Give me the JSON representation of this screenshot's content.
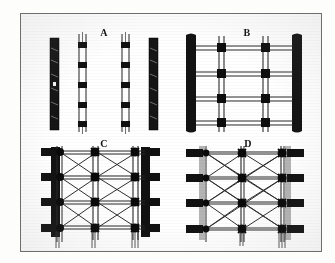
{
  "plate": {
    "background_color": "#ffffff",
    "page_color": "#fdfdfc",
    "border_color": "#6e6e6e",
    "ink_color": "#111111",
    "gray_ink_color": "#9a9a9a"
  },
  "figures": [
    {
      "id": "A",
      "label": "A",
      "caption": "A",
      "description": "Four separate vertical framing members shown in isolation: two solid dark posts and two slotted posts with spaced connector blocks",
      "members": [
        {
          "kind": "solid-post",
          "fill": "#111111"
        },
        {
          "kind": "slotted-post",
          "blocks": 5,
          "fill": "#111111"
        },
        {
          "kind": "slotted-post",
          "blocks": 5,
          "fill": "#111111"
        },
        {
          "kind": "solid-post",
          "fill": "#111111"
        }
      ]
    },
    {
      "id": "B",
      "label": "B",
      "caption": "B",
      "description": "Rectangular grid frame: two heavy outer posts, two inner vertical members and four horizontal rails with square junction blocks, no diagonal bracing",
      "posts": 2,
      "inner_verticals": 2,
      "horizontal_rails": 4,
      "junction_blocks": 8,
      "bracing": "none"
    },
    {
      "id": "C",
      "label": "C",
      "caption": "C",
      "description": "Braced grid frame with heavy black outer posts carrying four tie tabs each, star-shaped junction nodes and diagonal cross bracing in every bay",
      "posts": 2,
      "post_style": "heavy-black",
      "tie_tabs_per_post": 4,
      "inner_verticals": 2,
      "horizontal_rails": 4,
      "junction_nodes": 8,
      "bracing": "full-diagonal-cross"
    },
    {
      "id": "D",
      "label": "D",
      "caption": "D",
      "description": "Braced grid frame with light gray slender posts and heavy projecting black tie tabs, star-shaped junction nodes and diagonal cross bracing in every bay",
      "posts": 2,
      "post_style": "light-gray-slender",
      "tie_tabs_per_post": 4,
      "inner_verticals": 2,
      "horizontal_rails": 4,
      "junction_nodes": 8,
      "bracing": "full-diagonal-cross"
    }
  ]
}
